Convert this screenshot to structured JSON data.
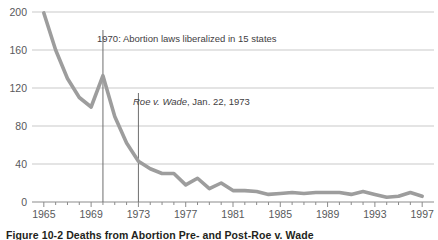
{
  "caption": {
    "figure_number": "Figure 10-2",
    "title": "Deaths from Abortion Pre- and Post-Roe v. Wade",
    "full": "Figure 10-2  Deaths from Abortion Pre- and Post-Roe v. Wade"
  },
  "annotations": [
    {
      "name": "annotation-1970",
      "text": "1970: Abortion laws liberalized in 15 states",
      "year": 1970,
      "italic_prefix": ""
    },
    {
      "name": "annotation-roe-v-wade",
      "text_italic": "Roe v. Wade",
      "text_rest": ", Jan. 22, 1973",
      "text": "Roe v. Wade, Jan. 22, 1973",
      "year": 1973
    }
  ],
  "colors": {
    "line": "#9d9d9d",
    "gridline": "#c9c9c9",
    "axis": "#8b8b8b",
    "tick_label": "#58595b",
    "annotation_text": "#3f4042",
    "annotation_rule": "#6e6e6e",
    "caption_text": "#231f20",
    "background": "#ffffff"
  },
  "chart_data": {
    "type": "line",
    "title": "Deaths from Abortion Pre- and Post-Roe v. Wade",
    "xlabel": "",
    "ylabel": "",
    "xlim": [
      1964,
      1998
    ],
    "ylim": [
      0,
      200
    ],
    "yticks": [
      0,
      40,
      80,
      120,
      160,
      200
    ],
    "ytick_labels": [
      "0",
      "40",
      "80",
      "120",
      "160",
      "200"
    ],
    "xticks": [
      1965,
      1969,
      1973,
      1977,
      1981,
      1985,
      1989,
      1993,
      1997
    ],
    "xtick_labels": [
      "1965",
      "1969",
      "1973",
      "1977",
      "1981",
      "1985",
      "1989",
      "1993",
      "1997"
    ],
    "x_minor_tick_interval": 1,
    "grid": "horizontal",
    "legend": "none",
    "series": [
      {
        "name": "Deaths from abortion",
        "x": [
          1965,
          1966,
          1967,
          1968,
          1969,
          1970,
          1971,
          1972,
          1973,
          1974,
          1975,
          1976,
          1977,
          1978,
          1979,
          1980,
          1981,
          1982,
          1983,
          1984,
          1985,
          1986,
          1987,
          1988,
          1989,
          1990,
          1991,
          1992,
          1993,
          1994,
          1995,
          1996,
          1997
        ],
        "values": [
          199,
          160,
          130,
          110,
          100,
          133,
          90,
          62,
          43,
          35,
          30,
          30,
          18,
          25,
          14,
          20,
          12,
          12,
          11,
          8,
          9,
          10,
          9,
          10,
          10,
          10,
          8,
          11,
          8,
          5,
          6,
          10,
          6
        ]
      }
    ],
    "vertical_markers": [
      {
        "x": 1970,
        "label": "1970: Abortion laws liberalized in 15 states"
      },
      {
        "x": 1973,
        "label": "Roe v. Wade, Jan. 22, 1973"
      }
    ]
  }
}
